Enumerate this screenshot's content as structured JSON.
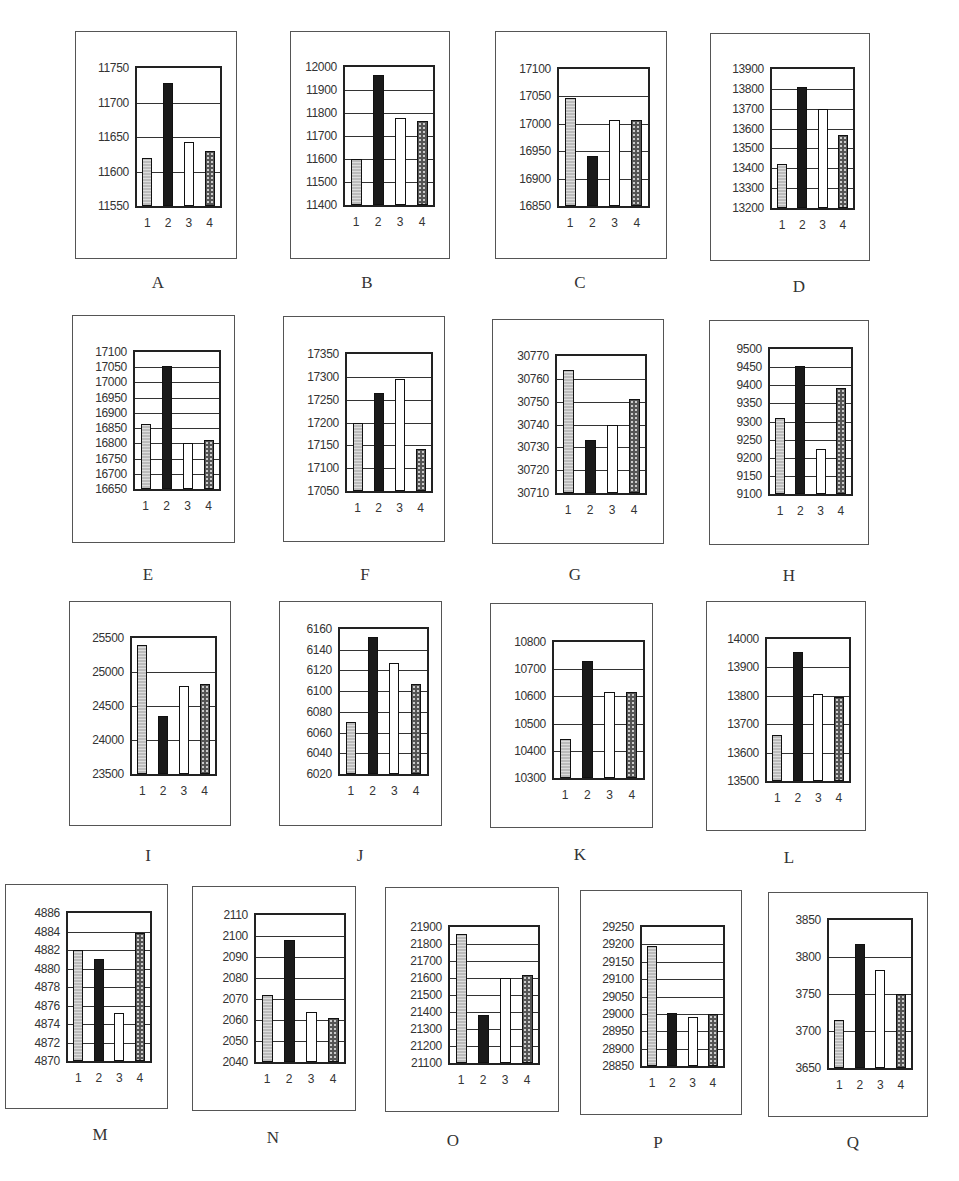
{
  "chart_data": [
    {
      "type": "bar",
      "title": "A",
      "categories": [
        "1",
        "2",
        "3",
        "4"
      ],
      "values": [
        11619,
        11728,
        11643,
        11630
      ],
      "yticks": [
        11550,
        11600,
        11650,
        11700,
        11750
      ],
      "ylim": [
        11550,
        11750
      ],
      "grid": true
    },
    {
      "type": "bar",
      "title": "B",
      "categories": [
        "1",
        "2",
        "3",
        "4"
      ],
      "values": [
        11600,
        11965,
        11780,
        11765
      ],
      "yticks": [
        11400,
        11500,
        11600,
        11700,
        11800,
        11900,
        12000
      ],
      "ylim": [
        11400,
        12000
      ],
      "grid": true
    },
    {
      "type": "bar",
      "title": "C",
      "categories": [
        "1",
        "2",
        "3",
        "4"
      ],
      "values": [
        17048,
        16942,
        17007,
        17007
      ],
      "yticks": [
        16850,
        16900,
        16950,
        17000,
        17050,
        17100
      ],
      "ylim": [
        16850,
        17100
      ],
      "grid": true
    },
    {
      "type": "bar",
      "title": "D",
      "categories": [
        "1",
        "2",
        "3",
        "4"
      ],
      "values": [
        13420,
        13810,
        13700,
        13570
      ],
      "yticks": [
        13200,
        13300,
        13400,
        13500,
        13600,
        13700,
        13800,
        13900
      ],
      "ylim": [
        13200,
        13900
      ],
      "grid": true
    },
    {
      "type": "bar",
      "title": "E",
      "categories": [
        "1",
        "2",
        "3",
        "4"
      ],
      "values": [
        16865,
        17055,
        16800,
        16810
      ],
      "yticks": [
        16650,
        16700,
        16750,
        16800,
        16850,
        16900,
        16950,
        17000,
        17050,
        17100
      ],
      "ylim": [
        16650,
        17100
      ],
      "grid": true
    },
    {
      "type": "bar",
      "title": "F",
      "categories": [
        "1",
        "2",
        "3",
        "4"
      ],
      "values": [
        17198,
        17265,
        17296,
        17143
      ],
      "yticks": [
        17050,
        17100,
        17150,
        17200,
        17250,
        17300,
        17350
      ],
      "ylim": [
        17050,
        17350
      ],
      "grid": true
    },
    {
      "type": "bar",
      "title": "G",
      "categories": [
        "1",
        "2",
        "3",
        "4"
      ],
      "values": [
        30764,
        30733,
        30740,
        30751
      ],
      "yticks": [
        30710,
        30720,
        30730,
        30740,
        30750,
        30760,
        30770
      ],
      "ylim": [
        30710,
        30770
      ],
      "grid": true
    },
    {
      "type": "bar",
      "title": "H",
      "categories": [
        "1",
        "2",
        "3",
        "4"
      ],
      "values": [
        9310,
        9453,
        9225,
        9393
      ],
      "yticks": [
        9100,
        9150,
        9200,
        9250,
        9300,
        9350,
        9400,
        9450,
        9500
      ],
      "ylim": [
        9100,
        9500
      ],
      "grid": true
    },
    {
      "type": "bar",
      "title": "I",
      "categories": [
        "1",
        "2",
        "3",
        "4"
      ],
      "values": [
        25390,
        24350,
        24800,
        24820
      ],
      "yticks": [
        23500,
        24000,
        24500,
        25000,
        25500
      ],
      "ylim": [
        23500,
        25500
      ],
      "grid": true
    },
    {
      "type": "bar",
      "title": "J",
      "categories": [
        "1",
        "2",
        "3",
        "4"
      ],
      "values": [
        6070,
        6152,
        6127,
        6107
      ],
      "yticks": [
        6020,
        6040,
        6060,
        6080,
        6100,
        6120,
        6140,
        6160
      ],
      "ylim": [
        6020,
        6160
      ],
      "grid": true
    },
    {
      "type": "bar",
      "title": "K",
      "categories": [
        "1",
        "2",
        "3",
        "4"
      ],
      "values": [
        10445,
        10730,
        10615,
        10615
      ],
      "yticks": [
        10300,
        10400,
        10500,
        10600,
        10700,
        10800
      ],
      "ylim": [
        10300,
        10800
      ],
      "grid": true
    },
    {
      "type": "bar",
      "title": "L",
      "categories": [
        "1",
        "2",
        "3",
        "4"
      ],
      "values": [
        13662,
        13953,
        13805,
        13795
      ],
      "yticks": [
        13500,
        13600,
        13700,
        13800,
        13900,
        14000
      ],
      "ylim": [
        13500,
        14000
      ],
      "grid": true
    },
    {
      "type": "bar",
      "title": "M",
      "categories": [
        "1",
        "2",
        "3",
        "4"
      ],
      "values": [
        4882,
        4881,
        4875.2,
        4883.8
      ],
      "yticks": [
        4870,
        4872,
        4874,
        4876,
        4878,
        4880,
        4882,
        4884,
        4886
      ],
      "ylim": [
        4870,
        4886
      ],
      "grid": true
    },
    {
      "type": "bar",
      "title": "N",
      "categories": [
        "1",
        "2",
        "3",
        "4"
      ],
      "values": [
        2072,
        2098,
        2064,
        2061
      ],
      "yticks": [
        2040,
        2050,
        2060,
        2070,
        2080,
        2090,
        2100,
        2110
      ],
      "ylim": [
        2040,
        2110
      ],
      "grid": true
    },
    {
      "type": "bar",
      "title": "O",
      "categories": [
        "1",
        "2",
        "3",
        "4"
      ],
      "values": [
        21860,
        21380,
        21600,
        21615
      ],
      "yticks": [
        21100,
        21200,
        21300,
        21400,
        21500,
        21600,
        21700,
        21800,
        21900
      ],
      "ylim": [
        21100,
        21900
      ],
      "grid": true
    },
    {
      "type": "bar",
      "title": "P",
      "categories": [
        "1",
        "2",
        "3",
        "4"
      ],
      "values": [
        29195,
        29002,
        28992,
        29000
      ],
      "yticks": [
        28850,
        28900,
        28950,
        29000,
        29050,
        29100,
        29150,
        29200,
        29250
      ],
      "ylim": [
        28850,
        29250
      ],
      "grid": true
    },
    {
      "type": "bar",
      "title": "Q",
      "categories": [
        "1",
        "2",
        "3",
        "4"
      ],
      "values": [
        3715,
        3817,
        3782,
        3750
      ],
      "yticks": [
        3650,
        3700,
        3750,
        3800,
        3850
      ],
      "ylim": [
        3650,
        3850
      ],
      "grid": true
    }
  ],
  "layout": [
    {
      "frame": [
        75,
        31,
        162,
        228
      ],
      "plot": [
        135,
        66,
        87,
        142
      ],
      "label": [
        143,
        283
      ]
    },
    {
      "frame": [
        290,
        31,
        160,
        228
      ],
      "plot": [
        343,
        65,
        92,
        142
      ],
      "label": [
        352,
        283
      ]
    },
    {
      "frame": [
        495,
        31,
        172,
        228
      ],
      "plot": [
        557,
        67,
        93,
        141
      ],
      "label": [
        565,
        283
      ]
    },
    {
      "frame": [
        710,
        33,
        160,
        228
      ],
      "plot": [
        770,
        67,
        85,
        143
      ],
      "label": [
        784,
        287
      ]
    },
    {
      "frame": [
        72,
        315,
        163,
        228
      ],
      "plot": [
        133,
        350,
        88,
        141
      ],
      "label": [
        133,
        575
      ]
    },
    {
      "frame": [
        283,
        316,
        162,
        226
      ],
      "plot": [
        345,
        352,
        88,
        141
      ],
      "label": [
        350,
        575
      ]
    },
    {
      "frame": [
        492,
        319,
        172,
        225
      ],
      "plot": [
        555,
        354,
        92,
        141
      ],
      "label": [
        560,
        575
      ]
    },
    {
      "frame": [
        709,
        320,
        160,
        225
      ],
      "plot": [
        768,
        347,
        85,
        149
      ],
      "label": [
        774,
        576
      ]
    },
    {
      "frame": [
        69,
        601,
        162,
        225
      ],
      "plot": [
        130,
        636,
        87,
        140
      ],
      "label": [
        133,
        856
      ]
    },
    {
      "frame": [
        279,
        601,
        163,
        225
      ],
      "plot": [
        338,
        627,
        91,
        149
      ],
      "label": [
        345,
        856
      ]
    },
    {
      "frame": [
        490,
        603,
        163,
        225
      ],
      "plot": [
        552,
        640,
        93,
        140
      ],
      "label": [
        565,
        855
      ]
    },
    {
      "frame": [
        706,
        601,
        160,
        230
      ],
      "plot": [
        765,
        637,
        86,
        146
      ],
      "label": [
        774,
        858
      ]
    },
    {
      "frame": [
        5,
        884,
        163,
        225
      ],
      "plot": [
        66,
        911,
        86,
        152
      ],
      "label": [
        85,
        1135
      ]
    },
    {
      "frame": [
        192,
        886,
        164,
        225
      ],
      "plot": [
        254,
        913,
        92,
        151
      ],
      "label": [
        258,
        1138
      ]
    },
    {
      "frame": [
        385,
        887,
        174,
        225
      ],
      "plot": [
        448,
        925,
        92,
        140
      ],
      "label": [
        438,
        1141
      ]
    },
    {
      "frame": [
        580,
        890,
        162,
        225
      ],
      "plot": [
        640,
        925,
        85,
        143
      ],
      "label": [
        643,
        1143
      ]
    },
    {
      "frame": [
        768,
        892,
        160,
        225
      ],
      "plot": [
        827,
        918,
        86,
        152
      ],
      "label": [
        838,
        1143
      ]
    }
  ]
}
